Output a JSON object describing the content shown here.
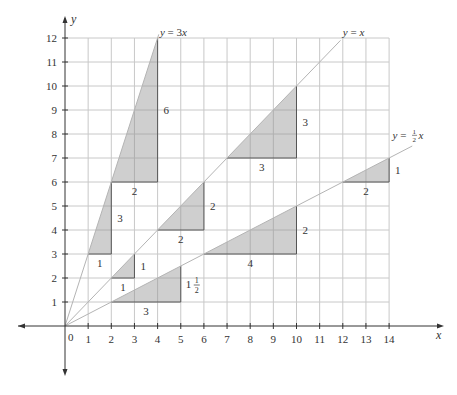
{
  "chart_data": {
    "type": "line",
    "title": "",
    "xlabel": "x",
    "ylabel": "y",
    "xlim": [
      0,
      14
    ],
    "ylim": [
      0,
      12
    ],
    "grid": true,
    "origin_label": "0",
    "x_ticks": [
      1,
      2,
      3,
      4,
      5,
      6,
      7,
      8,
      9,
      10,
      11,
      12,
      13,
      14
    ],
    "y_ticks": [
      1,
      2,
      3,
      4,
      5,
      6,
      7,
      8,
      9,
      10,
      11,
      12
    ],
    "series": [
      {
        "name": "y = 3x",
        "slope": 3,
        "x_end": 4.05,
        "label_x": 4.1,
        "label_y": 12.1
      },
      {
        "name": "y = x",
        "slope": 1,
        "x_end": 11.9,
        "label_x": 12.0,
        "label_y": 12.1
      },
      {
        "name": "y = 1/2 x",
        "slope": 0.5,
        "x_end": 15.0,
        "label_x": 14.15,
        "label_y": 7.8
      }
    ],
    "slope_triangles": [
      {
        "line": "y = 3x",
        "x1": 1,
        "x2": 2,
        "run": "1",
        "rise": "3"
      },
      {
        "line": "y = 3x",
        "x1": 2,
        "x2": 4,
        "run": "2",
        "rise": "6"
      },
      {
        "line": "y = x",
        "x1": 2,
        "x2": 3,
        "run": "1",
        "rise": "1"
      },
      {
        "line": "y = x",
        "x1": 4,
        "x2": 6,
        "run": "2",
        "rise": "2"
      },
      {
        "line": "y = x",
        "x1": 7,
        "x2": 10,
        "run": "3",
        "rise": "3"
      },
      {
        "line": "y = 1/2 x",
        "x1": 2,
        "x2": 5,
        "run": "3",
        "rise": "1 1/2"
      },
      {
        "line": "y = 1/2 x",
        "x1": 6,
        "x2": 10,
        "run": "4",
        "rise": "2"
      },
      {
        "line": "y = 1/2 x",
        "x1": 12,
        "x2": 14,
        "run": "2",
        "rise": "1"
      }
    ],
    "colors": {
      "grid": "#c8c8c8",
      "axis": "#333333",
      "line": "#b4b4b4",
      "triangle_fill": "#cfcfcf",
      "triangle_stroke": "#555555"
    }
  }
}
